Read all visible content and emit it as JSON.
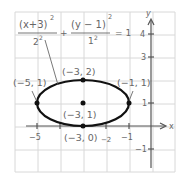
{
  "equation": {
    "num_left": "(x+3)",
    "num_left_exp": "2",
    "den_left": "2",
    "den_left_exp": "2",
    "plus": "+",
    "num_right": "(y − 1)",
    "num_right_exp": "2",
    "den_right": "1",
    "den_right_exp": "2",
    "equals": "= 1"
  },
  "axes": {
    "x_label": "x",
    "y_label": "y",
    "x_ticks": [
      "−5",
      "−2",
      "−1"
    ],
    "y_ticks": [
      "4",
      "3",
      "1",
      "−1"
    ]
  },
  "points": [
    {
      "label": "(−5, 1)",
      "x": -5,
      "y": 1
    },
    {
      "label": "(−3, 2)",
      "x": -3,
      "y": 2
    },
    {
      "label": "(−1, 1)",
      "x": -1,
      "y": 1
    },
    {
      "label": "(−3, 1)",
      "x": -3,
      "y": 1
    },
    {
      "label": "(−3, 0)",
      "x": -3,
      "y": 0
    }
  ],
  "ellipse": {
    "center": [
      -3,
      1
    ],
    "a": 2,
    "b": 1
  },
  "colors": {
    "grid": "#d8d8d8",
    "axis": "#555555",
    "curve": "#111111",
    "text": "#666666"
  }
}
